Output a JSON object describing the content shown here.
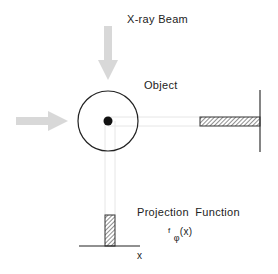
{
  "labels": {
    "beam": "X-ray Beam",
    "object": "Object",
    "projection": "Projection Function",
    "func_f": "f",
    "func_sub": "φ",
    "func_arg": "(x)",
    "axis_x": "x"
  },
  "colors": {
    "arrow": "#d6d6d6",
    "ray": "#e8e8e8",
    "line": "#222222",
    "hatch": "#444444",
    "background": "#ffffff"
  }
}
